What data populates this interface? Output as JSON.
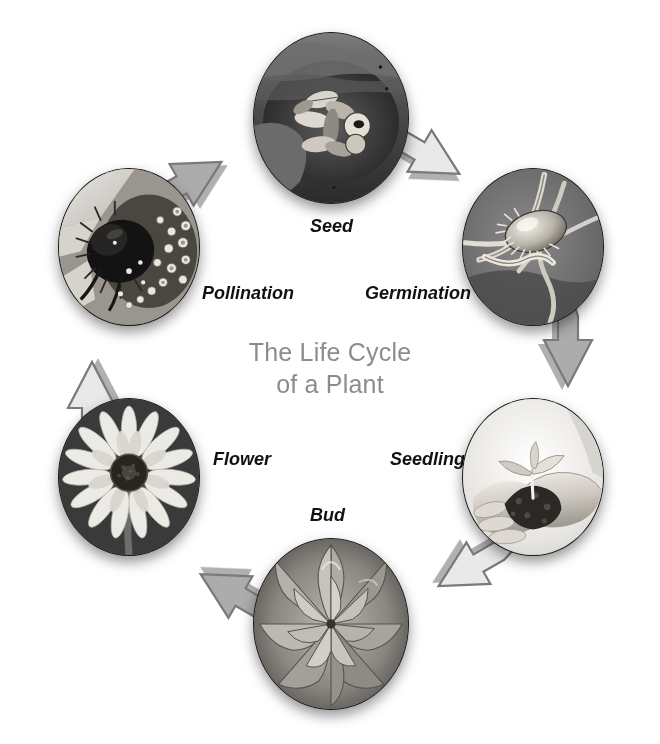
{
  "diagram": {
    "title_line1": "The Life Cycle",
    "title_line2": "of a Plant",
    "title_text": "The Life Cycle\nof a Plant",
    "title_color": "#8c8c8c",
    "flow_direction": "clockwise",
    "background": "#ffffff",
    "arrow_light_color": "#e9e9e9",
    "arrow_dark_color": "#acacac",
    "arrow_outline_color": "#6f6f6f",
    "label_color": "#111111",
    "stages": [
      {
        "id": "seed",
        "label": "Seed",
        "order": 1,
        "position": "top",
        "image_name": "seeds-in-hand-photo",
        "image_description": "Grayscale close-up of sunflower seeds held in a cupped hand"
      },
      {
        "id": "germination",
        "label": "Germination",
        "order": 2,
        "position": "upper-right",
        "image_name": "germinating-seed-photo",
        "image_description": "Grayscale close-up of a sprouting seed with emerging root and shoot"
      },
      {
        "id": "seedling",
        "label": "Seedling",
        "order": 3,
        "position": "lower-right",
        "image_name": "seedling-in-hands-photo",
        "image_description": "Grayscale photo of two hands cupping soil with a small green seedling"
      },
      {
        "id": "bud",
        "label": "Bud",
        "order": 4,
        "position": "bottom",
        "image_name": "flower-bud-photo",
        "image_description": "Grayscale macro photo of a tightly closed flower bud seen from above"
      },
      {
        "id": "flower",
        "label": "Flower",
        "order": 5,
        "position": "lower-left",
        "image_name": "sunflower-bloom-photo",
        "image_description": "Grayscale photo of an open sunflower bloom on a dark background"
      },
      {
        "id": "pollination",
        "label": "Pollination",
        "order": 6,
        "position": "upper-left",
        "image_name": "bee-pollinating-photo",
        "image_description": "Grayscale macro photo of a bumblebee collecting pollen on a flower head"
      }
    ]
  }
}
